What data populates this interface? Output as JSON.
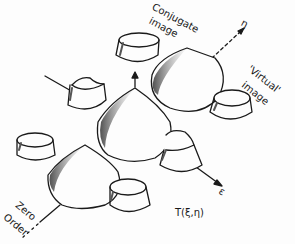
{
  "labels": {
    "conjugate": "Conjugate",
    "conjugate_image": "image",
    "virtual": "'Virtual'",
    "virtual_image": "image",
    "zero": "Zero",
    "order": "Order",
    "eta": "η",
    "epsilon": "ε",
    "transform": "T(ξ,η)"
  },
  "colors": {
    "ink": "#1a1a1a",
    "shade": "#555555",
    "background": "#fdfdfd"
  }
}
